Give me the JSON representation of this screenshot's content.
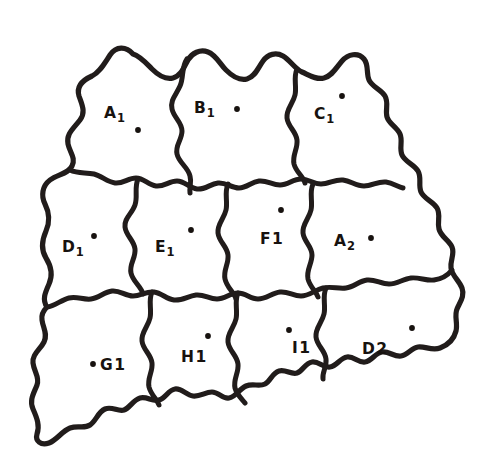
{
  "figure": {
    "background_color": "#ffffff",
    "ink_color": "#211c1b",
    "dot_color": "#17120f",
    "stroke_width": 5.2,
    "cell_count": 11,
    "row_layout": [
      3,
      4,
      4
    ]
  },
  "cells": [
    {
      "id": "a1",
      "label_letter": "A",
      "label_index": "1",
      "index_style": "subscript",
      "row": 1,
      "label_x": 104,
      "label_y": 106,
      "dot_x": 138,
      "dot_y": 130,
      "dot_r": 2.9
    },
    {
      "id": "b1",
      "label_letter": "B",
      "label_index": "1",
      "index_style": "subscript",
      "row": 1,
      "label_x": 194,
      "label_y": 101,
      "dot_x": 237,
      "dot_y": 109,
      "dot_r": 2.9
    },
    {
      "id": "c1",
      "label_letter": "C",
      "label_index": "1",
      "index_style": "subscript",
      "row": 1,
      "label_x": 314,
      "label_y": 107,
      "dot_x": 342,
      "dot_y": 96,
      "dot_r": 2.9
    },
    {
      "id": "d1",
      "label_letter": "D",
      "label_index": "1",
      "index_style": "subscript",
      "row": 2,
      "label_x": 62,
      "label_y": 240,
      "dot_x": 94,
      "dot_y": 236,
      "dot_r": 2.9
    },
    {
      "id": "e1",
      "label_letter": "E",
      "label_index": "1",
      "index_style": "subscript",
      "row": 2,
      "label_x": 155,
      "label_y": 240,
      "dot_x": 191,
      "dot_y": 230,
      "dot_r": 2.9
    },
    {
      "id": "f1",
      "label_letter": "F",
      "label_index": "1",
      "index_style": "inline",
      "row": 2,
      "label_x": 260,
      "label_y": 232,
      "dot_x": 281,
      "dot_y": 210,
      "dot_r": 2.9
    },
    {
      "id": "a2",
      "label_letter": "A",
      "label_index": "2",
      "index_style": "subscript",
      "row": 2,
      "label_x": 334,
      "label_y": 234,
      "dot_x": 371,
      "dot_y": 238,
      "dot_r": 2.9
    },
    {
      "id": "g1",
      "label_letter": "G",
      "label_index": "1",
      "index_style": "inline",
      "row": 3,
      "label_x": 100,
      "label_y": 358,
      "dot_x": 93,
      "dot_y": 364,
      "dot_r": 2.9
    },
    {
      "id": "h1",
      "label_letter": "H",
      "label_index": "1",
      "index_style": "inline",
      "row": 3,
      "label_x": 181,
      "label_y": 350,
      "dot_x": 208,
      "dot_y": 336,
      "dot_r": 2.9
    },
    {
      "id": "i1",
      "label_letter": "I",
      "label_index": "1",
      "index_style": "inline",
      "row": 3,
      "label_x": 292,
      "label_y": 341,
      "dot_x": 289,
      "dot_y": 330,
      "dot_r": 2.9
    },
    {
      "id": "d2",
      "label_letter": "D",
      "label_index": "2",
      "index_style": "inline",
      "row": 3,
      "label_x": 362,
      "label_y": 342,
      "dot_x": 412,
      "dot_y": 328,
      "dot_r": 2.9
    }
  ]
}
